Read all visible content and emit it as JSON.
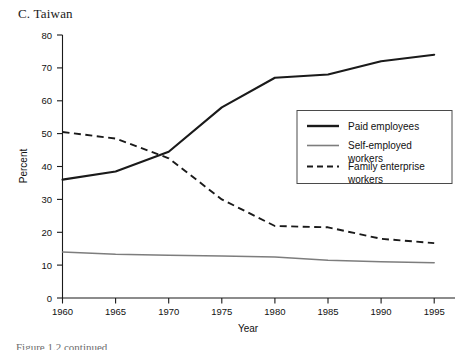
{
  "panel": {
    "title": "C. Taiwan"
  },
  "caption": {
    "text": "Figure 1.2 continued"
  },
  "axes": {
    "y_title": "Percent",
    "x_title": "Year",
    "y_ticks": [
      "0",
      "10",
      "20",
      "30",
      "40",
      "50",
      "60",
      "70",
      "80"
    ],
    "x_ticks": [
      "1960",
      "1965",
      "1970",
      "1975",
      "1980",
      "1985",
      "1990",
      "1995"
    ]
  },
  "legend": {
    "items": [
      {
        "label_line1": "Paid employees",
        "label_line2": "",
        "style": "solid-thick",
        "color": "#1a1a1a"
      },
      {
        "label_line1": "Self-employed",
        "label_line2": "workers",
        "style": "solid-thin",
        "color": "#7d7d7d"
      },
      {
        "label_line1": "Family enterprise",
        "label_line2": "workers",
        "style": "dashed",
        "color": "#1a1a1a"
      }
    ]
  },
  "chart_data": {
    "type": "line",
    "title": "C. Taiwan",
    "xlabel": "Year",
    "ylabel": "Percent",
    "xlim": [
      1960,
      1995
    ],
    "ylim": [
      0,
      80
    ],
    "grid": false,
    "legend_position": "center-right",
    "x": [
      1960,
      1965,
      1970,
      1975,
      1980,
      1985,
      1990,
      1995
    ],
    "series": [
      {
        "name": "Paid employees",
        "color": "#1a1a1a",
        "style": "solid",
        "values": [
          36.0,
          38.5,
          44.5,
          58.0,
          67.0,
          68.0,
          72.0,
          74.0
        ]
      },
      {
        "name": "Self-employed workers",
        "color": "#7d7d7d",
        "style": "solid",
        "values": [
          14.0,
          13.3,
          13.0,
          12.8,
          12.5,
          11.5,
          11.0,
          10.7
        ]
      },
      {
        "name": "Family enterprise workers",
        "color": "#1a1a1a",
        "style": "dashed",
        "values": [
          50.5,
          48.5,
          42.5,
          30.0,
          21.9,
          21.5,
          18.0,
          16.7
        ]
      }
    ]
  }
}
